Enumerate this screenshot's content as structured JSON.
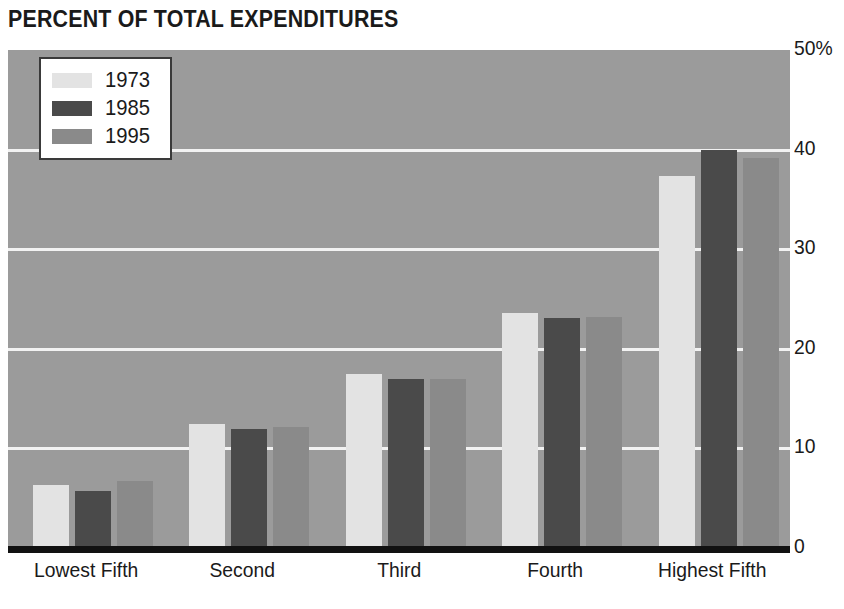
{
  "chart_data": {
    "type": "bar",
    "title": "PERCENT OF TOTAL EXPENDITURES",
    "xlabel": "",
    "ylabel": "",
    "ylim": [
      0,
      50
    ],
    "yticks": [
      0,
      10,
      20,
      30,
      40,
      50
    ],
    "ytick_labels": [
      "0",
      "10",
      "20",
      "30",
      "40",
      "50%"
    ],
    "grid": true,
    "legend_position": "top-left",
    "categories": [
      "Lowest Fifth",
      "Second",
      "Third",
      "Fourth",
      "Highest Fifth"
    ],
    "series": [
      {
        "name": "1973",
        "color": "#e3e3e3",
        "values": [
          6.3,
          12.5,
          17.5,
          23.6,
          37.4
        ]
      },
      {
        "name": "1985",
        "color": "#4a4a4a",
        "values": [
          5.7,
          11.9,
          17.0,
          23.1,
          40.0
        ]
      },
      {
        "name": "1995",
        "color": "#8a8a8a",
        "values": [
          6.7,
          12.2,
          17.0,
          23.2,
          39.2
        ]
      }
    ]
  },
  "style": {
    "plot_background": "#9b9b9b",
    "gridline_color": "#f2f2f2",
    "axis_color": "#111111",
    "text_color": "#1a1a1a",
    "page_background": "#ffffff"
  }
}
